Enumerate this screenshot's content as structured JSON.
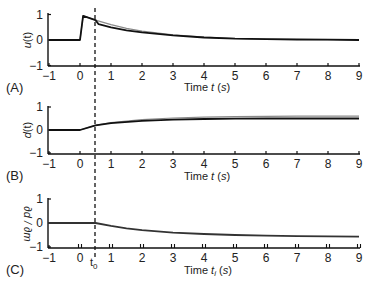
{
  "chart_data": [
    {
      "type": "line",
      "panel_label": "(A)",
      "ylabel": "u(t)",
      "xlabel": "Time t (s)",
      "xlim": [
        -1,
        9
      ],
      "ylim": [
        -1,
        1
      ],
      "xticks": [
        -1,
        0,
        1,
        2,
        3,
        4,
        5,
        6,
        7,
        8,
        9
      ],
      "yticks": [
        -1,
        0,
        1
      ],
      "grid": false,
      "series": [
        {
          "name": "gray",
          "color": "#8a8a8a",
          "x": [
            -1,
            0,
            0.1,
            0.5,
            1,
            1.5,
            2,
            3,
            4,
            5,
            6,
            7,
            8,
            9
          ],
          "y": [
            0,
            0,
            0.95,
            0.78,
            0.6,
            0.46,
            0.35,
            0.2,
            0.11,
            0.06,
            0.03,
            0.02,
            0.01,
            0.0
          ]
        },
        {
          "name": "black",
          "color": "#111111",
          "x": [
            -1,
            0,
            0.1,
            0.5,
            0.6,
            1,
            1.5,
            2,
            3,
            4,
            5,
            6,
            7,
            8,
            9
          ],
          "y": [
            0,
            0,
            0.95,
            0.78,
            0.62,
            0.5,
            0.38,
            0.3,
            0.18,
            0.1,
            0.05,
            0.03,
            0.02,
            0.01,
            0.0
          ]
        }
      ]
    },
    {
      "type": "line",
      "panel_label": "(B)",
      "ylabel": "d(t)",
      "xlabel": "Time t (s)",
      "xlim": [
        -1,
        9
      ],
      "ylim": [
        -1,
        1
      ],
      "xticks": [
        -1,
        0,
        1,
        2,
        3,
        4,
        5,
        6,
        7,
        8,
        9
      ],
      "yticks": [
        -1,
        0,
        1
      ],
      "grid": false,
      "series": [
        {
          "name": "gray",
          "color": "#8a8a8a",
          "x": [
            -1,
            0,
            0.5,
            1,
            2,
            3,
            4,
            5,
            6,
            7,
            8,
            9
          ],
          "y": [
            0,
            0,
            0.2,
            0.32,
            0.45,
            0.52,
            0.56,
            0.58,
            0.59,
            0.6,
            0.6,
            0.6
          ]
        },
        {
          "name": "black",
          "color": "#111111",
          "x": [
            -1,
            0,
            0.5,
            1,
            2,
            3,
            4,
            5,
            6,
            7,
            8,
            9
          ],
          "y": [
            0,
            0,
            0.2,
            0.3,
            0.4,
            0.45,
            0.48,
            0.49,
            0.5,
            0.5,
            0.5,
            0.5
          ]
        }
      ]
    },
    {
      "type": "line",
      "panel_label": "(C)",
      "ylabel": "∂d/∂m",
      "xlabel": "Time t_i (s)",
      "xlim": [
        -1,
        9
      ],
      "ylim": [
        -1,
        1
      ],
      "xticks": [
        -1,
        0,
        1,
        2,
        3,
        4,
        5,
        6,
        7,
        8,
        9
      ],
      "yticks": [
        -1,
        0,
        1
      ],
      "extra_xtick_label": "t0",
      "extra_xtick_value": 0.5,
      "grid": false,
      "series": [
        {
          "name": "black",
          "color": "#333333",
          "x": [
            -1,
            0,
            0.5,
            1,
            1.5,
            2,
            3,
            4,
            5,
            6,
            7,
            8,
            9
          ],
          "y": [
            0,
            0,
            0,
            -0.12,
            -0.22,
            -0.3,
            -0.4,
            -0.46,
            -0.5,
            -0.53,
            -0.55,
            -0.56,
            -0.57
          ]
        }
      ]
    }
  ],
  "figure": {
    "dashed_line_x": 0.5,
    "t0_label": "t",
    "t0_sub": "0"
  },
  "labels": {
    "a": {
      "panel": "(A)",
      "ylabel_base": "u",
      "ylabel_arg": "(t)",
      "xlabel_pre": "Time ",
      "xlabel_var": "t",
      "xlabel_post": " (",
      "xlabel_unit": "s",
      "xlabel_end": ")"
    },
    "b": {
      "panel": "(B)",
      "ylabel_base": "d",
      "ylabel_arg": "(t)",
      "xlabel_pre": "Time ",
      "xlabel_var": "t",
      "xlabel_post": " (",
      "xlabel_unit": "s",
      "xlabel_end": ")"
    },
    "c": {
      "panel": "(C)",
      "ylabel": "∂d / ∂m",
      "xlabel_pre": "Time ",
      "xlabel_var": "t",
      "xlabel_sub": "i",
      "xlabel_post": " (",
      "xlabel_unit": "s",
      "xlabel_end": ")"
    }
  },
  "ticklabels": {
    "x": [
      "−1",
      "0",
      "1",
      "2",
      "3",
      "4",
      "5",
      "6",
      "7",
      "8",
      "9"
    ],
    "y": [
      "1",
      "0",
      "−1"
    ]
  }
}
